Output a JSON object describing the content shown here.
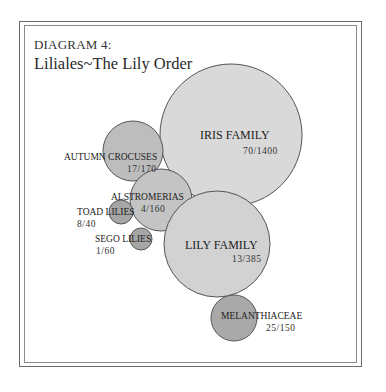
{
  "header": {
    "label": "DIAGRAM 4:",
    "title": "Liliales~The Lily Order"
  },
  "colors": {
    "large_fill": "#d9d9d9",
    "medium_fill": "#bdbdbd",
    "small_fill": "#a6a6a6",
    "stroke": "#555555",
    "frame": "#6a6a6a"
  },
  "families": [
    {
      "name": "IRIS FAMILY",
      "ratio": "70/1400",
      "genera": 70,
      "species": 1400
    },
    {
      "name": "AUTUMN CROCUSES",
      "ratio": "17/170",
      "genera": 17,
      "species": 170
    },
    {
      "name": "ALSTROMERIAS",
      "ratio": "4/160",
      "genera": 4,
      "species": 160
    },
    {
      "name": "TOAD LILIES",
      "ratio": "8/40",
      "genera": 8,
      "species": 40
    },
    {
      "name": "SEGO LILIES",
      "ratio": "1/60",
      "genera": 1,
      "species": 60
    },
    {
      "name": "LILY FAMILY",
      "ratio": "13/385",
      "genera": 13,
      "species": 385
    },
    {
      "name": "MELANTHIACEAE",
      "ratio": "25/150",
      "genera": 25,
      "species": 150
    }
  ]
}
